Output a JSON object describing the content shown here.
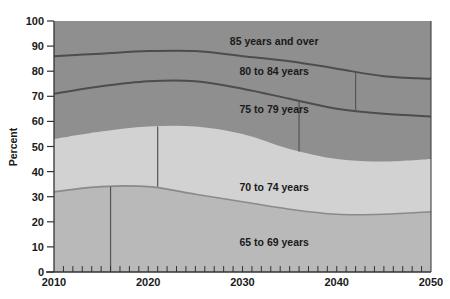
{
  "chart_data": {
    "type": "area",
    "stacked": true,
    "title": "",
    "xlabel": "",
    "ylabel": "Percent",
    "xlim": [
      2010,
      2050
    ],
    "ylim": [
      0,
      100
    ],
    "x_ticks": [
      2010,
      2020,
      2030,
      2040,
      2050
    ],
    "y_ticks": [
      0,
      10,
      20,
      30,
      40,
      50,
      60,
      70,
      80,
      90,
      100
    ],
    "x_minor_tick_step": 1,
    "grid": false,
    "legend": "inline labels",
    "x": [
      2010,
      2015,
      2020,
      2025,
      2030,
      2035,
      2040,
      2045,
      2050
    ],
    "cumulative_boundaries": {
      "65 to 69 years (top)": [
        32,
        34,
        34,
        31,
        28,
        25,
        23,
        23,
        24
      ],
      "70 to 74 years (top)": [
        53,
        56,
        58,
        58,
        55,
        49,
        45,
        44,
        45
      ],
      "75 to 79 years (top)": [
        71,
        74,
        76,
        76,
        73,
        69,
        65,
        63,
        62
      ],
      "80 to 84 years (top)": [
        86,
        87,
        88,
        88,
        86,
        84,
        81,
        78,
        77
      ],
      "85 years and over (top)": [
        100,
        100,
        100,
        100,
        100,
        100,
        100,
        100,
        100
      ]
    },
    "series": [
      {
        "name": "65 to 69 years",
        "values": [
          32,
          34,
          34,
          31,
          28,
          25,
          23,
          23,
          24
        ],
        "color": "#b9b9b9",
        "label_pos": [
          2034,
          12
        ]
      },
      {
        "name": "70 to 74 years",
        "values": [
          21,
          22,
          24,
          27,
          27,
          24,
          22,
          21,
          21
        ],
        "color": "#d2d2d2",
        "label_pos": [
          2034,
          34
        ]
      },
      {
        "name": "75 to 79 years",
        "values": [
          18,
          18,
          18,
          18,
          18,
          20,
          20,
          19,
          17
        ],
        "color": "#8f8f8f",
        "label_pos": [
          2034,
          65
        ]
      },
      {
        "name": "80 to 84 years",
        "values": [
          15,
          13,
          12,
          12,
          13,
          15,
          16,
          15,
          15
        ],
        "color": "#8f8f8f",
        "label_pos": [
          2034,
          80
        ]
      },
      {
        "name": "85 years and over",
        "values": [
          14,
          13,
          12,
          12,
          14,
          16,
          19,
          22,
          23
        ],
        "color": "#8f8f8f",
        "label_pos": [
          2034,
          92
        ]
      }
    ],
    "markers": [
      {
        "x": 2016,
        "y_from": 0,
        "y_to": 34
      },
      {
        "x": 2021,
        "y_from": 34,
        "y_to": 58
      },
      {
        "x": 2036,
        "y_from": 48,
        "y_to": 68
      },
      {
        "x": 2042,
        "y_from": 64,
        "y_to": 80
      }
    ]
  },
  "colors": {
    "boundary_line_dark": "#4d4d4d",
    "boundary_line_light": "#8a8a8a",
    "axis": "#333333"
  }
}
